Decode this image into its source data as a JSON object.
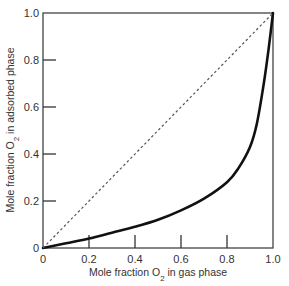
{
  "chart_data": {
    "type": "line",
    "title": "",
    "xlabel": "Mole fraction O2 in gas phase",
    "ylabel": "Mole fraction O2 in adsorbed phase",
    "xlabel_parts": {
      "pre": "Mole fraction O",
      "sub": "2",
      "post": " in gas phase"
    },
    "ylabel_parts": {
      "pre": "Mole fraction O",
      "sub": "2",
      "post": " in adsorbed phase"
    },
    "xlim": [
      0,
      1.0
    ],
    "ylim": [
      0,
      1.0
    ],
    "x_ticks": [
      "0",
      "0.2",
      "0.4",
      "0.6",
      "0.8",
      "1.0"
    ],
    "y_ticks": [
      "0",
      "0.2",
      "0.4",
      "0.6",
      "0.8",
      "1.0"
    ],
    "grid": false,
    "legend": null,
    "series": [
      {
        "name": "Adsorption equilibrium curve",
        "style": "solid",
        "color": "#111111",
        "x": [
          0.0,
          0.1,
          0.2,
          0.3,
          0.4,
          0.5,
          0.6,
          0.7,
          0.8,
          0.85,
          0.9,
          0.93,
          0.96,
          0.98,
          1.0
        ],
        "y": [
          0.0,
          0.02,
          0.04,
          0.065,
          0.09,
          0.12,
          0.16,
          0.21,
          0.28,
          0.34,
          0.43,
          0.53,
          0.7,
          0.84,
          1.0
        ]
      },
      {
        "name": "Diagonal (y = x)",
        "style": "dashed",
        "color": "#555555",
        "x": [
          0.0,
          1.0
        ],
        "y": [
          0.0,
          1.0
        ]
      }
    ]
  }
}
